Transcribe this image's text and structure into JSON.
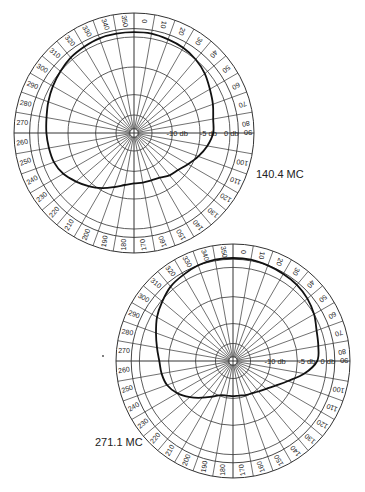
{
  "chart_data": [
    {
      "type": "polar",
      "title": "140.4 MC",
      "angle_unit": "degrees",
      "angle_ticks": [
        0,
        10,
        20,
        30,
        40,
        50,
        60,
        70,
        80,
        90,
        100,
        110,
        120,
        130,
        140,
        150,
        160,
        170,
        180,
        190,
        200,
        210,
        220,
        230,
        240,
        250,
        260,
        270,
        280,
        290,
        300,
        310,
        320,
        330,
        340,
        350
      ],
      "radial_labels": [
        "-10 db",
        "-5 db",
        "0 db"
      ],
      "radial_axis_angle": 90,
      "grid": true,
      "pattern_angles": [
        0,
        10,
        20,
        30,
        40,
        50,
        60,
        70,
        80,
        90,
        100,
        110,
        120,
        130,
        140,
        150,
        160,
        170,
        180,
        190,
        200,
        210,
        220,
        230,
        240,
        250,
        260,
        270,
        280,
        290,
        300,
        310,
        320,
        330,
        340,
        350
      ],
      "pattern_radius_fraction": [
        0.84,
        0.84,
        0.83,
        0.82,
        0.8,
        0.77,
        0.73,
        0.7,
        0.67,
        0.66,
        0.62,
        0.57,
        0.52,
        0.48,
        0.46,
        0.43,
        0.42,
        0.42,
        0.42,
        0.44,
        0.48,
        0.53,
        0.58,
        0.63,
        0.68,
        0.71,
        0.72,
        0.73,
        0.74,
        0.76,
        0.78,
        0.8,
        0.82,
        0.83,
        0.84,
        0.84
      ]
    },
    {
      "type": "polar",
      "title": "271.1 MC",
      "angle_unit": "degrees",
      "angle_ticks": [
        0,
        10,
        20,
        30,
        40,
        50,
        60,
        70,
        80,
        90,
        100,
        110,
        120,
        130,
        140,
        150,
        160,
        170,
        180,
        190,
        200,
        210,
        220,
        230,
        240,
        250,
        260,
        270,
        280,
        290,
        300,
        310,
        320,
        330,
        340,
        350
      ],
      "radial_labels": [
        "-10 db",
        "-5 db",
        "0 db"
      ],
      "radial_axis_angle": 90,
      "grid": true,
      "pattern_angles": [
        0,
        10,
        20,
        30,
        40,
        50,
        60,
        70,
        80,
        90,
        100,
        110,
        120,
        130,
        140,
        150,
        160,
        170,
        180,
        190,
        200,
        210,
        220,
        230,
        240,
        250,
        260,
        270,
        280,
        290,
        300,
        310,
        320,
        330,
        340,
        350
      ],
      "pattern_radius_fraction": [
        0.88,
        0.88,
        0.87,
        0.86,
        0.85,
        0.83,
        0.8,
        0.76,
        0.74,
        0.72,
        0.62,
        0.5,
        0.42,
        0.37,
        0.34,
        0.32,
        0.31,
        0.3,
        0.3,
        0.3,
        0.31,
        0.35,
        0.41,
        0.48,
        0.55,
        0.6,
        0.62,
        0.63,
        0.66,
        0.7,
        0.75,
        0.79,
        0.83,
        0.85,
        0.87,
        0.88
      ]
    }
  ],
  "charts": {
    "top": {
      "label": "140.4 MC",
      "center": [
        134,
        133
      ],
      "radius": 120,
      "label_ring_fraction": 0.87,
      "ring_fractions": [
        0.035,
        0.15,
        0.32,
        0.55,
        0.8
      ],
      "radial_text": [
        "-10 db",
        "-5 db",
        "0 db",
        "90"
      ],
      "radial_text_fraction": [
        0.36,
        0.62,
        0.81,
        0.95
      ]
    },
    "bottom": {
      "label": "271.1 MC",
      "center": [
        233,
        361
      ],
      "radius": 117,
      "label_ring_fraction": 0.87,
      "ring_fractions": [
        0.035,
        0.15,
        0.32,
        0.55,
        0.8
      ],
      "radial_text": [
        "-10 db",
        "-5 db",
        "0 db",
        "90"
      ],
      "radial_text_fraction": [
        0.36,
        0.63,
        0.81,
        0.95
      ]
    }
  },
  "labels": {
    "top_freq": "140.4 MC",
    "bottom_freq": "271.1 MC"
  }
}
